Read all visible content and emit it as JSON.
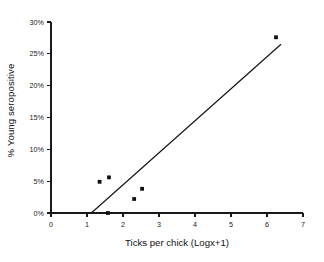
{
  "chart_data": {
    "type": "scatter",
    "title": "",
    "subtitle": "",
    "xlabel": "Ticks per chick (Logx+1)",
    "ylabel": "% Young seropositive",
    "xlim": [
      0,
      7
    ],
    "ylim": [
      0,
      30
    ],
    "xticks": [
      0,
      1,
      2,
      3,
      4,
      5,
      6,
      7
    ],
    "xticklabels": [
      "0",
      "1",
      "2",
      "3",
      "4",
      "5",
      "6",
      "7"
    ],
    "yticks": [
      0,
      5,
      10,
      15,
      20,
      25,
      30
    ],
    "yticklabels": [
      "0%",
      "5%",
      "10%",
      "15%",
      "20%",
      "25%",
      "30%"
    ],
    "grid": false,
    "legend": false,
    "legend_position": "none",
    "marker": "square",
    "marker_color": "#111111",
    "series": [
      {
        "name": "Observations",
        "x": [
          1.35,
          1.58,
          1.61,
          2.31,
          2.53,
          6.25
        ],
        "y": [
          4.9,
          0.0,
          5.6,
          2.2,
          3.8,
          27.6
        ]
      }
    ],
    "annotations": [],
    "trendline": {
      "name": "Regression line",
      "x": [
        1.12,
        6.39
      ],
      "y": [
        0.0,
        26.5
      ],
      "color": "#111111"
    }
  },
  "figure": {
    "background_color": "#ffffff",
    "axis_color": "#1a1a1a",
    "text_color": "#111111"
  }
}
